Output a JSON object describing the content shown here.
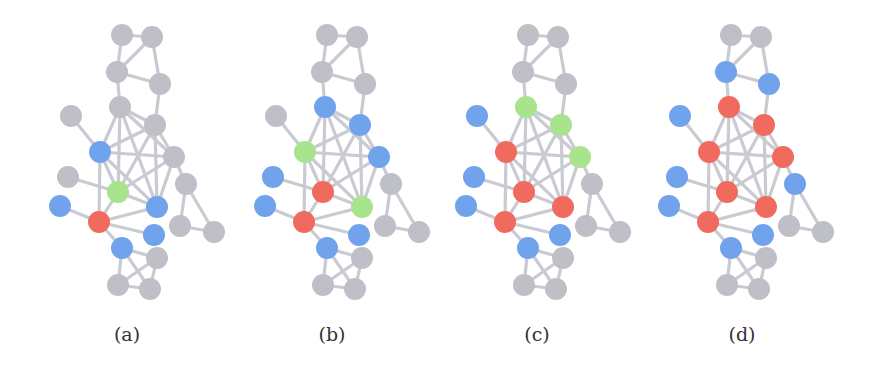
{
  "figure": {
    "colors": {
      "grey": "#bfbfc8",
      "blue": "#70a3ec",
      "green": "#a7e48c",
      "red": "#f06a5e",
      "edge": "#cacad2"
    },
    "node_radius": 11,
    "nodes": [
      {
        "id": "t1",
        "x": 122,
        "y": 35
      },
      {
        "id": "t2",
        "x": 152,
        "y": 37
      },
      {
        "id": "n3",
        "x": 117,
        "y": 72
      },
      {
        "id": "n4",
        "x": 160,
        "y": 84
      },
      {
        "id": "n5",
        "x": 120,
        "y": 107
      },
      {
        "id": "n6",
        "x": 71,
        "y": 116
      },
      {
        "id": "n7",
        "x": 155,
        "y": 125
      },
      {
        "id": "n8",
        "x": 100,
        "y": 152
      },
      {
        "id": "n9",
        "x": 174,
        "y": 157
      },
      {
        "id": "n10",
        "x": 68,
        "y": 177
      },
      {
        "id": "n11",
        "x": 118,
        "y": 192
      },
      {
        "id": "n12",
        "x": 186,
        "y": 184
      },
      {
        "id": "n13",
        "x": 60,
        "y": 206
      },
      {
        "id": "n14",
        "x": 157,
        "y": 207
      },
      {
        "id": "n15",
        "x": 99,
        "y": 222
      },
      {
        "id": "n16",
        "x": 154,
        "y": 235
      },
      {
        "id": "n17",
        "x": 180,
        "y": 226
      },
      {
        "id": "n18",
        "x": 214,
        "y": 232
      },
      {
        "id": "n19",
        "x": 122,
        "y": 248
      },
      {
        "id": "n20",
        "x": 157,
        "y": 258
      },
      {
        "id": "n21",
        "x": 118,
        "y": 285
      },
      {
        "id": "n22",
        "x": 150,
        "y": 289
      }
    ],
    "edges": [
      [
        "t1",
        "t2"
      ],
      [
        "t1",
        "n3"
      ],
      [
        "t2",
        "n3"
      ],
      [
        "t2",
        "n4"
      ],
      [
        "n3",
        "n4"
      ],
      [
        "n3",
        "n5"
      ],
      [
        "n4",
        "n7"
      ],
      [
        "n5",
        "n7"
      ],
      [
        "n5",
        "n8"
      ],
      [
        "n5",
        "n9"
      ],
      [
        "n5",
        "n11"
      ],
      [
        "n5",
        "n14"
      ],
      [
        "n7",
        "n8"
      ],
      [
        "n7",
        "n9"
      ],
      [
        "n7",
        "n11"
      ],
      [
        "n7",
        "n14"
      ],
      [
        "n8",
        "n9"
      ],
      [
        "n8",
        "n11"
      ],
      [
        "n8",
        "n14"
      ],
      [
        "n8",
        "n15"
      ],
      [
        "n9",
        "n11"
      ],
      [
        "n9",
        "n14"
      ],
      [
        "n9",
        "n12"
      ],
      [
        "n11",
        "n14"
      ],
      [
        "n11",
        "n15"
      ],
      [
        "n14",
        "n15"
      ],
      [
        "n6",
        "n8"
      ],
      [
        "n10",
        "n11"
      ],
      [
        "n13",
        "n15"
      ],
      [
        "n15",
        "n16"
      ],
      [
        "n15",
        "n19"
      ],
      [
        "n12",
        "n17"
      ],
      [
        "n12",
        "n18"
      ],
      [
        "n17",
        "n18"
      ],
      [
        "n19",
        "n20"
      ],
      [
        "n19",
        "n21"
      ],
      [
        "n19",
        "n22"
      ],
      [
        "n20",
        "n21"
      ],
      [
        "n20",
        "n22"
      ],
      [
        "n21",
        "n22"
      ]
    ],
    "panels": [
      {
        "label": "(a)",
        "dx": 0,
        "label_x": 97,
        "node_colors": {
          "t1": "grey",
          "t2": "grey",
          "n3": "grey",
          "n4": "grey",
          "n5": "grey",
          "n6": "grey",
          "n7": "grey",
          "n8": "blue",
          "n9": "grey",
          "n10": "grey",
          "n11": "green",
          "n12": "grey",
          "n13": "blue",
          "n14": "blue",
          "n15": "red",
          "n16": "blue",
          "n17": "grey",
          "n18": "grey",
          "n19": "blue",
          "n20": "grey",
          "n21": "grey",
          "n22": "grey"
        }
      },
      {
        "label": "(b)",
        "dx": 205,
        "label_x": 302,
        "node_colors": {
          "t1": "grey",
          "t2": "grey",
          "n3": "grey",
          "n4": "grey",
          "n5": "blue",
          "n6": "grey",
          "n7": "blue",
          "n8": "green",
          "n9": "blue",
          "n10": "blue",
          "n11": "red",
          "n12": "grey",
          "n13": "blue",
          "n14": "green",
          "n15": "red",
          "n16": "blue",
          "n17": "grey",
          "n18": "grey",
          "n19": "blue",
          "n20": "grey",
          "n21": "grey",
          "n22": "grey"
        }
      },
      {
        "label": "(c)",
        "dx": 406,
        "label_x": 507,
        "node_colors": {
          "t1": "grey",
          "t2": "grey",
          "n3": "grey",
          "n4": "grey",
          "n5": "green",
          "n6": "blue",
          "n7": "green",
          "n8": "red",
          "n9": "green",
          "n10": "blue",
          "n11": "red",
          "n12": "grey",
          "n13": "blue",
          "n14": "red",
          "n15": "red",
          "n16": "blue",
          "n17": "grey",
          "n18": "grey",
          "n19": "blue",
          "n20": "grey",
          "n21": "grey",
          "n22": "grey"
        }
      },
      {
        "label": "(d)",
        "dx": 609,
        "label_x": 712,
        "node_colors": {
          "t1": "grey",
          "t2": "grey",
          "n3": "blue",
          "n4": "blue",
          "n5": "red",
          "n6": "blue",
          "n7": "red",
          "n8": "red",
          "n9": "red",
          "n10": "blue",
          "n11": "red",
          "n12": "blue",
          "n13": "blue",
          "n14": "red",
          "n15": "red",
          "n16": "blue",
          "n17": "grey",
          "n18": "grey",
          "n19": "blue",
          "n20": "grey",
          "n21": "grey",
          "n22": "grey"
        }
      }
    ]
  }
}
